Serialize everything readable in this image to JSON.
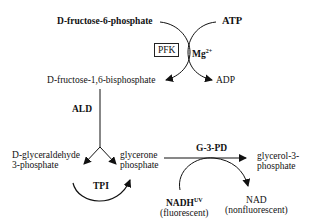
{
  "diagram": {
    "type": "biochemical pathway",
    "nodes": {
      "f6p": {
        "prefix": "D",
        "text": "-fructose-6-phosphate"
      },
      "atp": "ATP",
      "pfk": "PFK",
      "mg": "Mg",
      "mg_sup": "2+",
      "adp": "ADP",
      "fbp": {
        "prefix": "D",
        "text": "-fructose-1,6-bisphosphate"
      },
      "ald": "ALD",
      "gap": {
        "prefix": "D",
        "line1": "-glyceraldehyde",
        "line2": "3-phosphate"
      },
      "dhap": {
        "line1": "glycerone",
        "line2": "phosphate"
      },
      "tpi": "TPI",
      "g3pd": "G-3-PD",
      "g3p": {
        "line1": "glycerol-3-",
        "line2": "phosphate"
      },
      "nadh": "NADH",
      "nadh_sup": "UV",
      "nadh_note": "(fluorescent)",
      "nad": "NAD",
      "nad_note": "(nonfluorescent)"
    },
    "edges": [
      {
        "from": "D-fructose-6-phosphate",
        "to": "D-fructose-1,6-bisphosphate",
        "enzyme": "PFK",
        "cofactor": "Mg2+"
      },
      {
        "from": "ATP",
        "to": "ADP"
      },
      {
        "from": "D-fructose-1,6-bisphosphate",
        "to": [
          "D-glyceraldehyde 3-phosphate",
          "glycerone phosphate"
        ],
        "enzyme": "ALD"
      },
      {
        "from": "D-glyceraldehyde 3-phosphate",
        "to": "glycerone phosphate",
        "enzyme": "TPI"
      },
      {
        "from": "glycerone phosphate",
        "to": "glycerol-3-phosphate",
        "enzyme": "G-3-PD"
      },
      {
        "from": "NADH",
        "to": "NAD"
      }
    ]
  }
}
